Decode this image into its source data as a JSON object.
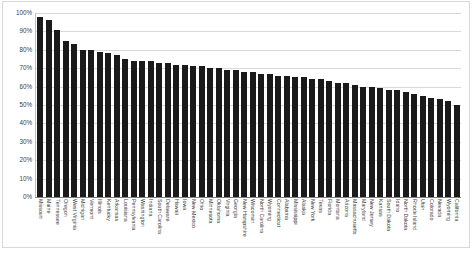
{
  "chart_data": {
    "type": "bar",
    "title": "",
    "xlabel": "",
    "ylabel": "",
    "ylim": [
      0,
      100
    ],
    "grid": true,
    "legend": false,
    "value_suffix": "%",
    "ytick_labels": [
      "100%",
      "90%",
      "80%",
      "70%",
      "60%",
      "50%",
      "40%",
      "30%",
      "20%",
      "10%",
      "0%"
    ],
    "ytick_values": [
      100,
      90,
      80,
      70,
      60,
      50,
      40,
      30,
      20,
      10,
      0
    ],
    "bar_color": "#1a1a1a",
    "gridline_color": "#d9d9d9",
    "categories": [
      "Missouri",
      "Maine",
      "Tennessee",
      "Oregon",
      "West Virginia",
      "Michigan",
      "Vermont",
      "Illinois",
      "Kentucky",
      "Arkansas",
      "Louisiana",
      "Pennsylvania",
      "Washington",
      "Indiana",
      "South Carolina",
      "Delaware",
      "Hawaii",
      "Iowa",
      "New Mexico",
      "Ohio",
      "Minnesota",
      "Oklahoma",
      "Virginia",
      "Georgia",
      "New Hampshire",
      "Wisconsin",
      "North Carolina",
      "Wyoming",
      "Connecticut",
      "Alabama",
      "Mississippi",
      "Alaska",
      "New York",
      "Texas",
      "Florida",
      "Montana",
      "Arizona",
      "Massachusetts",
      "Maryland",
      "New Jersey",
      "Kansas",
      "South Dakota",
      "Idaho",
      "North Dakota",
      "Rhode Island",
      "Utah",
      "Colorado",
      "Nevada",
      "Wyoming",
      "California"
    ],
    "values": [
      98,
      96,
      91,
      85,
      83,
      80,
      80,
      79,
      78,
      77,
      75,
      74,
      74,
      74,
      73,
      73,
      72,
      72,
      71,
      71,
      70,
      70,
      69,
      69,
      68,
      68,
      67,
      67,
      66,
      66,
      65,
      65,
      64,
      64,
      63,
      62,
      62,
      61,
      60,
      60,
      59,
      58,
      58,
      57,
      56,
      55,
      54,
      53,
      52,
      50
    ]
  }
}
